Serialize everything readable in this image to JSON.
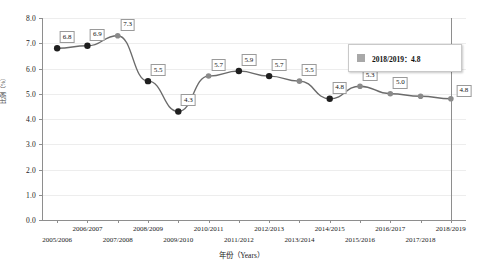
{
  "chart_data": {
    "type": "line",
    "title": "",
    "subtitle": "",
    "xlabel": "年份（Years）",
    "ylabel": "比例（%）",
    "categories": [
      "2005/2006",
      "2006/2007",
      "2007/2008",
      "2008/2009",
      "2009/2010",
      "2010/2011",
      "2011/2012",
      "2012/2013",
      "2013/2014",
      "2014/2015",
      "2015/2016",
      "2016/2017",
      "2017/2018",
      "2018/2019"
    ],
    "values": [
      6.8,
      6.9,
      7.3,
      5.5,
      4.3,
      5.7,
      5.9,
      5.7,
      5.5,
      4.8,
      5.3,
      5.0,
      4.9,
      4.8
    ],
    "point_labels": [
      "6.8",
      "6.9",
      "7.3",
      "5.5",
      "4.3",
      "5.7",
      "5.9",
      "5.7",
      "5.5",
      "4.8",
      "5.3",
      "5.0",
      "",
      "4.8"
    ],
    "marker_shades": [
      "dark",
      "dark",
      "light",
      "dark",
      "dark",
      "light",
      "dark",
      "dark",
      "light",
      "dark",
      "light",
      "light",
      "light",
      "light"
    ],
    "ylim": [
      0.0,
      8.0
    ],
    "ytick_values": [
      "0.0",
      "1.0",
      "2.0",
      "3.0",
      "4.0",
      "5.0",
      "6.0",
      "7.0",
      "8.0"
    ],
    "grid": true,
    "legend_position": "inside-right",
    "legend": [
      {
        "label": "2018/2019：4.8",
        "swatch_color": "#a8a8a8"
      }
    ],
    "annotations": [
      {
        "name": "reference-line",
        "at_category": "2018/2019"
      }
    ],
    "colors": {
      "line": "#6b6b6b",
      "marker_dark": "#1f1f1f",
      "marker_light": "#8a8a8a",
      "grid": "#ededed",
      "axis": "#8e8e8e",
      "label_border": "#9a9a9a"
    }
  }
}
